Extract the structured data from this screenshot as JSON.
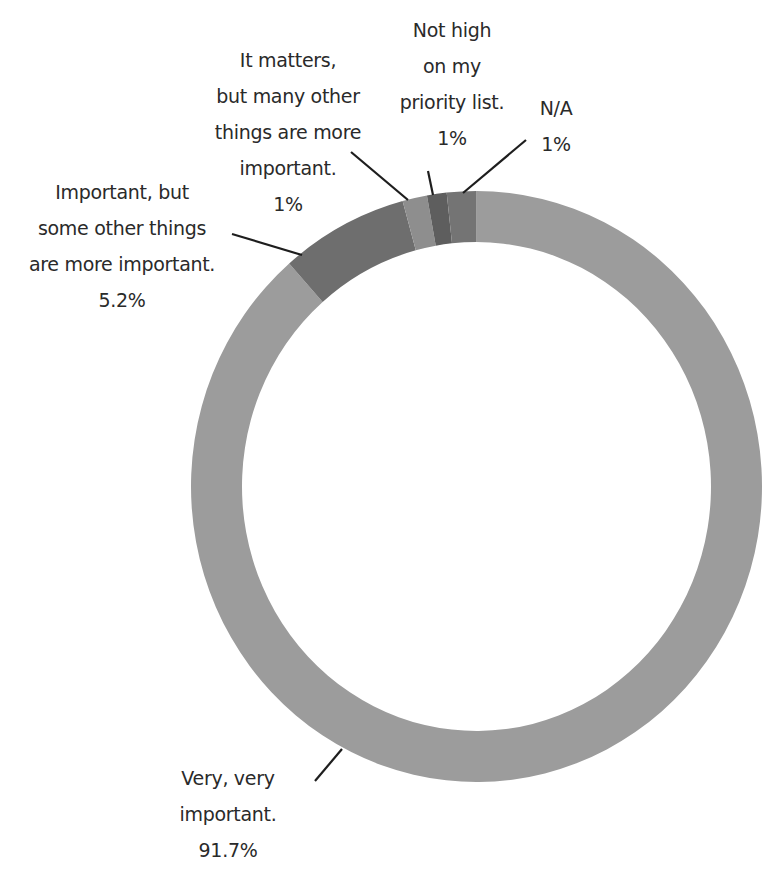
{
  "chart_data": {
    "type": "pie",
    "variant": "donut",
    "title": "",
    "categories": [
      "Very, very important.",
      "Important, but some other things are more important.",
      "It matters, but many other things are more important.",
      "Not high on my priority list.",
      "N/A"
    ],
    "values": [
      91.7,
      5.2,
      1,
      1,
      1
    ],
    "value_labels": [
      "91.7%",
      "5.2%",
      "1%",
      "1%",
      "1%"
    ],
    "colors": [
      "#9c9c9c",
      "#6e6e6e",
      "#8e8e8e",
      "#5e5e5e",
      "#747474"
    ],
    "legend": "none (leader-line labels)",
    "start_angle_deg": 0,
    "direction": "clockwise",
    "drawn_angles_deg": [
      [
        0,
        319
      ],
      [
        319,
        345
      ],
      [
        345,
        350
      ],
      [
        350,
        354
      ],
      [
        354,
        360
      ]
    ]
  },
  "labels": {
    "very_important": {
      "lines": [
        "Very, very",
        "important."
      ],
      "pct": "91.7%"
    },
    "important_but": {
      "lines": [
        "Important, but",
        "some other things",
        "are more important."
      ],
      "pct": "5.2%"
    },
    "it_matters": {
      "lines": [
        "It matters,",
        "but many other",
        "things are more",
        "important."
      ],
      "pct": "1%"
    },
    "not_high": {
      "lines": [
        "Not high",
        "on my",
        "priority list."
      ],
      "pct": "1%"
    },
    "na": {
      "lines": [
        "N/A"
      ],
      "pct": "1%"
    }
  }
}
